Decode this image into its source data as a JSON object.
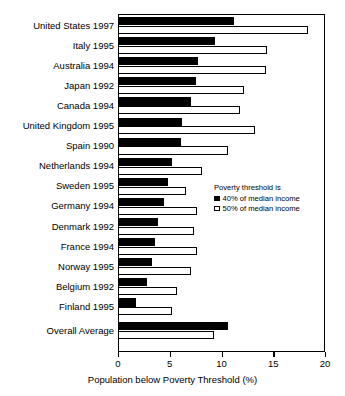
{
  "chart_data": {
    "type": "bar",
    "orientation": "horizontal",
    "title": "",
    "xlabel": "Population below Poverty Threshold (%)",
    "ylabel": "",
    "xlim": [
      0,
      20
    ],
    "xticks": [
      0,
      5,
      10,
      15,
      20
    ],
    "grid": false,
    "legend_position": "inside-right",
    "legend_title": "Poverty threshold is",
    "categories": [
      "United States 1997",
      "Italy 1995",
      "Australia 1994",
      "Japan 1992",
      "Canada 1994",
      "United Kingdom 1995",
      "Spain 1990",
      "Netherlands 1994",
      "Sweden 1995",
      "Germany 1994",
      "Denmark 1992",
      "France 1994",
      "Norway 1995",
      "Belgium 1992",
      "Finland 1995",
      "Overall Average"
    ],
    "series": [
      {
        "name": "40% of median income",
        "style": "filled",
        "values": [
          11.2,
          9.4,
          7.7,
          7.5,
          7.1,
          6.2,
          6.1,
          5.2,
          4.8,
          4.4,
          3.9,
          3.6,
          3.3,
          2.8,
          1.7,
          10.6
        ]
      },
      {
        "name": "50% of median income",
        "style": "hollow",
        "values": [
          18.4,
          14.4,
          14.3,
          12.2,
          11.8,
          13.2,
          10.6,
          8.1,
          6.6,
          7.6,
          7.3,
          7.6,
          7.1,
          5.7,
          5.2,
          9.3
        ]
      }
    ]
  },
  "legend": {
    "title": "Poverty threshold is",
    "entries": [
      {
        "label": "40% of median income",
        "style": "filled"
      },
      {
        "label": "50% of median income",
        "style": "hollow"
      }
    ]
  },
  "axis": {
    "x_title": "Population below Poverty Threshold (%)",
    "x_tick_labels": [
      "0",
      "5",
      "10",
      "15",
      "20"
    ]
  }
}
